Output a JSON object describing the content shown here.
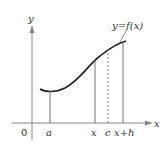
{
  "diagram": {
    "curve_label": "y=f(x)",
    "axis_x_label": "x",
    "axis_y_label": "y",
    "origin_label": "0",
    "ticks": [
      {
        "label": "a",
        "style": "solid"
      },
      {
        "label": "x",
        "style": "solid"
      },
      {
        "label": "c",
        "style": "dashed"
      },
      {
        "label": "x+h",
        "style": "solid"
      }
    ],
    "colors": {
      "axis": "#888888",
      "curve": "#222222",
      "lines": "#666666"
    }
  }
}
